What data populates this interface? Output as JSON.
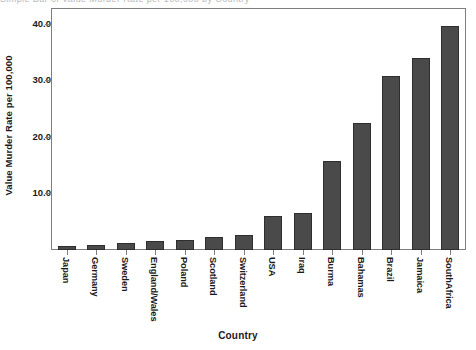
{
  "chart_data": {
    "type": "bar",
    "title": "",
    "xlabel": "Country",
    "ylabel": "Value Murder Rate per 100,000",
    "ylim": [
      0,
      42.6
    ],
    "grid": false,
    "legend": null,
    "ytick_labels": [
      "10.0",
      "20.0",
      "30.0",
      "40.0"
    ],
    "ytick_values": [
      10,
      20,
      30,
      40
    ],
    "categories": [
      "Japan",
      "Germany",
      "Sweden",
      "England/Wales",
      "Poland",
      "Scotland",
      "Switzerland",
      "USA",
      "Iraq",
      "Burma",
      "Bahamas",
      "Brazil",
      "Jamaica",
      "SouthAfrica"
    ],
    "values": [
      0.7,
      0.9,
      1.2,
      1.6,
      1.7,
      2.3,
      2.6,
      6.0,
      6.6,
      15.7,
      22.4,
      30.7,
      33.9,
      39.6
    ],
    "bar_color": "#4a4a4a",
    "bar_edge_color": "#2e2e2e",
    "axis_color": "#7e7e7e"
  },
  "top_clip_text": "Simple Bar of Value Murder Rate per 100,000 by Country"
}
